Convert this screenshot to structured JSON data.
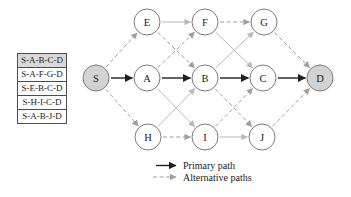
{
  "colors": {
    "edge_primary": "#1f1f1f",
    "edge_alt_solid": "#b9b9b9",
    "edge_alt_dashed": "#9f9f9f",
    "node_stroke": "#7d7d7d",
    "node_fill": "#ffffff",
    "node_fill_shaded": "#d3d3d3",
    "table_border": "#4d4d4d",
    "highlight_bg": "#d9d9d9",
    "text": "#1a1a1a"
  },
  "path_list": {
    "items": [
      {
        "label": "S-A-B-C-D",
        "highlighted": true
      },
      {
        "label": "S-A-F-G-D",
        "highlighted": false
      },
      {
        "label": "S-E-B-C-D",
        "highlighted": false
      },
      {
        "label": "S-H-I-C-D",
        "highlighted": false
      },
      {
        "label": "S-A-B-J-D",
        "highlighted": false
      }
    ]
  },
  "graph": {
    "node_radius": 13,
    "nodes": [
      {
        "id": "S",
        "label": "S",
        "x": 96,
        "y": 78,
        "shaded": true
      },
      {
        "id": "A",
        "label": "A",
        "x": 147,
        "y": 78,
        "shaded": false
      },
      {
        "id": "B",
        "label": "B",
        "x": 205,
        "y": 78,
        "shaded": false
      },
      {
        "id": "C",
        "label": "C",
        "x": 263,
        "y": 78,
        "shaded": false
      },
      {
        "id": "D",
        "label": "D",
        "x": 320,
        "y": 78,
        "shaded": true
      },
      {
        "id": "E",
        "label": "E",
        "x": 147,
        "y": 22,
        "shaded": false
      },
      {
        "id": "F",
        "label": "F",
        "x": 205,
        "y": 22,
        "shaded": false
      },
      {
        "id": "G",
        "label": "G",
        "x": 264,
        "y": 22,
        "shaded": false
      },
      {
        "id": "H",
        "label": "H",
        "x": 148,
        "y": 137,
        "shaded": false
      },
      {
        "id": "I",
        "label": "I",
        "x": 205,
        "y": 137,
        "shaded": false
      },
      {
        "id": "J",
        "label": "J",
        "x": 262,
        "y": 137,
        "shaded": false
      }
    ],
    "edges": [
      {
        "from": "S",
        "to": "A",
        "type": "primary"
      },
      {
        "from": "A",
        "to": "B",
        "type": "primary"
      },
      {
        "from": "B",
        "to": "C",
        "type": "primary"
      },
      {
        "from": "C",
        "to": "D",
        "type": "primary"
      },
      {
        "from": "E",
        "to": "F",
        "type": "alt_solid"
      },
      {
        "from": "I",
        "to": "J",
        "type": "alt_solid"
      },
      {
        "from": "H",
        "to": "B",
        "type": "alt_solid"
      },
      {
        "from": "A",
        "to": "I",
        "type": "alt_solid"
      },
      {
        "from": "B",
        "to": "G",
        "type": "alt_solid"
      },
      {
        "from": "F",
        "to": "C",
        "type": "alt_solid"
      },
      {
        "from": "S",
        "to": "E",
        "type": "alt_dashed"
      },
      {
        "from": "S",
        "to": "H",
        "type": "alt_dashed"
      },
      {
        "from": "A",
        "to": "F",
        "type": "alt_dashed"
      },
      {
        "from": "E",
        "to": "B",
        "type": "alt_dashed"
      },
      {
        "from": "F",
        "to": "G",
        "type": "alt_dashed"
      },
      {
        "from": "H",
        "to": "I",
        "type": "alt_dashed"
      },
      {
        "from": "B",
        "to": "J",
        "type": "alt_dashed"
      },
      {
        "from": "I",
        "to": "C",
        "type": "alt_dashed"
      },
      {
        "from": "G",
        "to": "D",
        "type": "alt_dashed"
      },
      {
        "from": "J",
        "to": "D",
        "type": "alt_dashed"
      }
    ]
  },
  "legend": {
    "primary": "Primary path",
    "alternative": "Alternative paths"
  }
}
